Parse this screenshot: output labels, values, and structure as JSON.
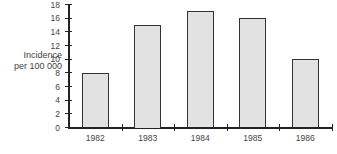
{
  "chart_data": {
    "type": "bar",
    "title": "",
    "xlabel": "",
    "ylabel": "Incidence per 100 000",
    "categories": [
      "1982",
      "1983",
      "1984",
      "1985",
      "1986"
    ],
    "values": [
      8,
      15,
      17,
      16,
      10
    ],
    "ylim": [
      0,
      18
    ],
    "yticks": [
      "0",
      "2",
      "4",
      "6",
      "8",
      "10",
      "12",
      "14",
      "16",
      "18"
    ],
    "grid": false,
    "legend": null
  },
  "ylabel_lines": [
    "Incidence",
    "per 100 000"
  ]
}
